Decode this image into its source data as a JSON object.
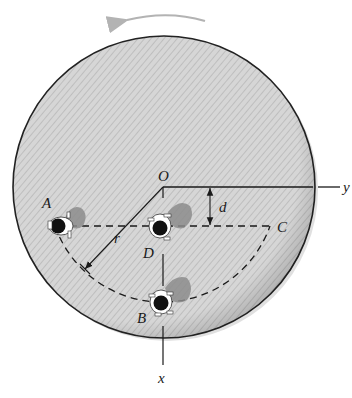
{
  "figure": {
    "rotation_direction": "counterclockwise",
    "labels": {
      "origin": "O",
      "x_axis": "x",
      "y_axis": "y",
      "point_a": "A",
      "point_b": "B",
      "point_c": "C",
      "point_d": "D",
      "radius": "r",
      "offset": "d"
    },
    "colors": {
      "platform_fill": "#cfcfcf",
      "platform_edge": "#222222",
      "rotation_arrow": "#b3b3b3",
      "shadow": "#8c8c8c",
      "line": "#1a1a1a"
    }
  }
}
